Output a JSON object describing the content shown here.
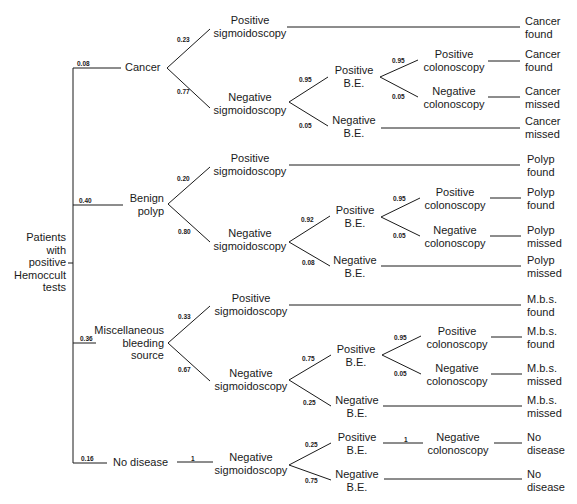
{
  "diagram": {
    "type": "decision-tree",
    "root": {
      "label": "Patients with positive Hemoccult tests",
      "lines": [
        "Patients",
        "with",
        "positive",
        "Hemoccult",
        "tests"
      ]
    },
    "branches": [
      {
        "name": "cancer",
        "probability": "0.08",
        "label": "Cancer",
        "children": [
          {
            "probability": "0.23",
            "label": [
              "Positive",
              "sigmoidoscopy"
            ],
            "outcome": [
              "Cancer",
              "found"
            ]
          },
          {
            "probability": "0.77",
            "label": [
              "Negative",
              "sigmoidoscopy"
            ],
            "children": [
              {
                "probability": "0.95",
                "label": [
                  "Positive",
                  "B.E."
                ],
                "children": [
                  {
                    "probability": "0.95",
                    "label": [
                      "Positive",
                      "colonoscopy"
                    ],
                    "outcome": [
                      "Cancer",
                      "found"
                    ]
                  },
                  {
                    "probability": "0.05",
                    "label": [
                      "Negative",
                      "colonoscopy"
                    ],
                    "outcome": [
                      "Cancer",
                      "missed"
                    ]
                  }
                ]
              },
              {
                "probability": "0.05",
                "label": [
                  "Negative",
                  "B.E."
                ],
                "outcome": [
                  "Cancer",
                  "missed"
                ]
              }
            ]
          }
        ]
      },
      {
        "name": "benign-polyp",
        "probability": "0.40",
        "label": [
          "Benign",
          "polyp"
        ],
        "children": [
          {
            "probability": "0.20",
            "label": [
              "Positive",
              "sigmoidoscopy"
            ],
            "outcome": [
              "Polyp",
              "found"
            ]
          },
          {
            "probability": "0.80",
            "label": [
              "Negative",
              "sigmoidoscopy"
            ],
            "children": [
              {
                "probability": "0.92",
                "label": [
                  "Positive",
                  "B.E."
                ],
                "children": [
                  {
                    "probability": "0.95",
                    "label": [
                      "Positive",
                      "colonoscopy"
                    ],
                    "outcome": [
                      "Polyp",
                      "found"
                    ]
                  },
                  {
                    "probability": "0.05",
                    "label": [
                      "Negative",
                      "colonoscopy"
                    ],
                    "outcome": [
                      "Polyp",
                      "missed"
                    ]
                  }
                ]
              },
              {
                "probability": "0.08",
                "label": [
                  "Negative",
                  "B.E."
                ],
                "outcome": [
                  "Polyp",
                  "missed"
                ]
              }
            ]
          }
        ]
      },
      {
        "name": "miscellaneous-bleeding-source",
        "probability": "0.36",
        "label": [
          "Miscellaneous",
          "bleeding",
          "source"
        ],
        "children": [
          {
            "probability": "0.33",
            "label": [
              "Positive",
              "sigmoidoscopy"
            ],
            "outcome": [
              "M.b.s.",
              "found"
            ]
          },
          {
            "probability": "0.67",
            "label": [
              "Negative",
              "sigmoidoscopy"
            ],
            "children": [
              {
                "probability": "0.75",
                "label": [
                  "Positive",
                  "B.E."
                ],
                "children": [
                  {
                    "probability": "0.95",
                    "label": [
                      "Positive",
                      "colonoscopy"
                    ],
                    "outcome": [
                      "M.b.s.",
                      "found"
                    ]
                  },
                  {
                    "probability": "0.05",
                    "label": [
                      "Negative",
                      "colonoscopy"
                    ],
                    "outcome": [
                      "M.b.s.",
                      "missed"
                    ]
                  }
                ]
              },
              {
                "probability": "0.25",
                "label": [
                  "Negative",
                  "B.E."
                ],
                "outcome": [
                  "M.b.s.",
                  "missed"
                ]
              }
            ]
          }
        ]
      },
      {
        "name": "no-disease",
        "probability": "0.16",
        "label": "No disease",
        "children": [
          {
            "probability": "1",
            "label": [
              "Negative",
              "sigmoidoscopy"
            ],
            "children": [
              {
                "probability": "0.25",
                "label": [
                  "Positive",
                  "B.E."
                ],
                "children": [
                  {
                    "probability": "1",
                    "label": [
                      "Negative",
                      "colonoscopy"
                    ],
                    "outcome": [
                      "No",
                      "disease"
                    ]
                  }
                ]
              },
              {
                "probability": "0.75",
                "label": [
                  "Negative",
                  "B.E."
                ],
                "outcome": [
                  "No",
                  "disease"
                ]
              }
            ]
          }
        ]
      }
    ]
  },
  "t": {
    "root": [
      "Patients",
      "with",
      "positive",
      "Hemoccult",
      "tests"
    ],
    "cancer": "Cancer",
    "polyp": [
      "Benign",
      "polyp"
    ],
    "mbs": [
      "Miscellaneous",
      "bleeding",
      "source"
    ],
    "nodis": "No disease",
    "pos": "Positive",
    "neg": "Negative",
    "sig": "sigmoidoscopy",
    "col": "colonoscopy",
    "be": "B.E.",
    "o_cancer": "Cancer",
    "o_polyp": "Polyp",
    "o_mbs": "M.b.s.",
    "o_no": "No",
    "found": "found",
    "missed": "missed",
    "disease": "disease",
    "p": {
      "cancer": "0.08",
      "polyp": "0.40",
      "mbs": "0.36",
      "nodis": "0.16",
      "c_pos_sig": "0.23",
      "c_neg_sig": "0.77",
      "c_pos_be": "0.95",
      "c_neg_be": "0.05",
      "c_pos_col": "0.95",
      "c_neg_col": "0.05",
      "p_pos_sig": "0.20",
      "p_neg_sig": "0.80",
      "p_pos_be": "0.92",
      "p_neg_be": "0.08",
      "p_pos_col": "0.95",
      "p_neg_col": "0.05",
      "m_pos_sig": "0.33",
      "m_neg_sig": "0.67",
      "m_pos_be": "0.75",
      "m_neg_be": "0.25",
      "m_pos_col": "0.95",
      "m_neg_col": "0.05",
      "n_neg_sig": "1",
      "n_pos_be": "0.25",
      "n_neg_be": "0.75",
      "n_neg_col": "1"
    }
  }
}
